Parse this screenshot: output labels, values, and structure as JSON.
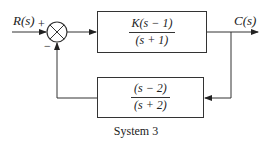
{
  "diagram": {
    "input_label": "R(s)",
    "output_label": "C(s)",
    "summing_junction": {
      "plus_sign": "+",
      "minus_sign": "−"
    },
    "forward_block": {
      "numerator": "K(s − 1)",
      "denominator": "(s + 1)"
    },
    "feedback_block": {
      "numerator": "(s − 2)",
      "denominator": "(s + 2)"
    },
    "caption": "System 3"
  }
}
